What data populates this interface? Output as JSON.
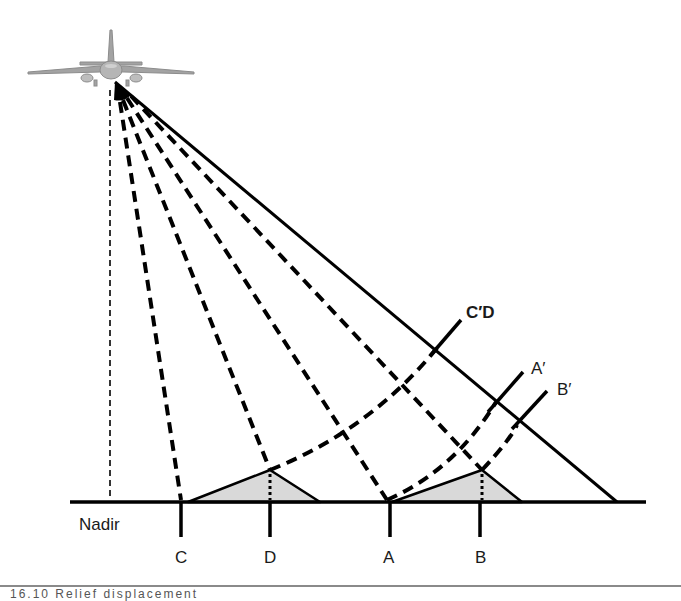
{
  "diagram": {
    "labels": {
      "nadir": "Nadir",
      "ground_points": [
        "C",
        "D",
        "A",
        "B"
      ],
      "image_points": {
        "cd": "C′D",
        "a": "A′",
        "b": "B′"
      }
    },
    "caption": "16.10 Relief displacement"
  },
  "colors": {
    "line": "#000000",
    "relief_fill": "#d9d9d9",
    "aircraft": "#9a9a9a",
    "caption_rule": "#8a8a8a"
  }
}
